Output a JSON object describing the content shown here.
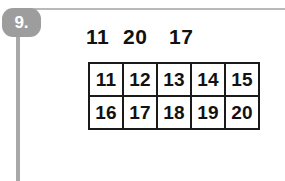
{
  "question": {
    "number_label": "9.",
    "prompt_numbers": [
      "11",
      "20",
      "17"
    ]
  },
  "number_grid": {
    "rows": [
      [
        "11",
        "12",
        "13",
        "14",
        "15"
      ],
      [
        "16",
        "17",
        "18",
        "19",
        "20"
      ]
    ]
  },
  "colors": {
    "badge_background": "#9d9d9d",
    "badge_text": "#ffffff",
    "rule": "#b9b9b9",
    "spine": "#a8a8a8",
    "grid_border": "#1a1a1a",
    "text": "#111111",
    "page_background": "#ffffff"
  }
}
